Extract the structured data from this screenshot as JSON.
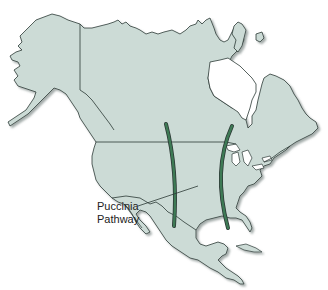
{
  "map": {
    "title": "North America",
    "land_color": "#ccdbd6",
    "border_color": "#2c3a36",
    "shadow_color": "#9aa5a2",
    "water_color": "#ffffff",
    "pathway_color": "#2f6a46",
    "annotation": {
      "line1": "Puccinia",
      "line2": "Pathway"
    },
    "features": [
      {
        "name": "western-pathway",
        "type": "curved band",
        "from": "southern Canada prairies",
        "to": "northern Mexico"
      },
      {
        "name": "eastern-pathway",
        "type": "curved band",
        "from": "Ontario / Great Lakes",
        "to": "Gulf of Mexico coast"
      }
    ]
  }
}
